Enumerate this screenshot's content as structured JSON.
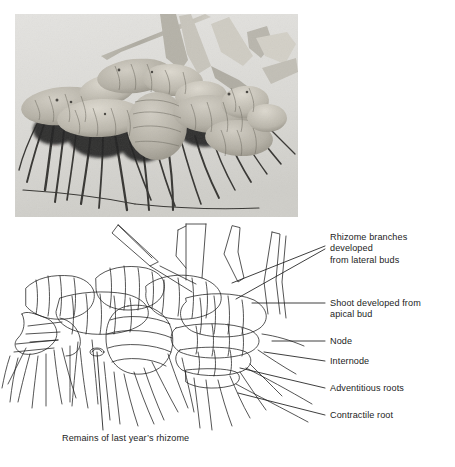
{
  "figure": {
    "type": "botanical-figure",
    "background_color": "#ffffff",
    "ink_color": "#1c1c1c"
  },
  "photo": {
    "caption_alt": "Black and white photograph of a clump of iris rhizomes with fibrous roots and cut leaf fans",
    "background_color": "#d9d9d7",
    "rhizome_color": "#b9b6ad",
    "root_color": "#2b2a28"
  },
  "labels": [
    {
      "id": "rhizome-branches",
      "text": "Rhizome branches\ndeveloped\nfrom lateral buds"
    },
    {
      "id": "shoot-apical",
      "text": "Shoot developed from\napical bud"
    },
    {
      "id": "node",
      "text": "Node"
    },
    {
      "id": "internode",
      "text": "Internode"
    },
    {
      "id": "adventitious-roots",
      "text": "Adventitious roots"
    },
    {
      "id": "contractile-root",
      "text": "Contractile root"
    },
    {
      "id": "remains",
      "text": "Remains of last year’s rhizome"
    }
  ],
  "footer": {
    "text": ""
  }
}
